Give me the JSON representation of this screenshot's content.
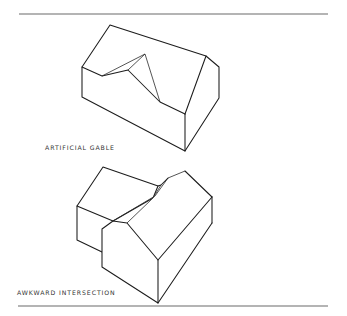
{
  "figures": [
    {
      "id": "artificial-gable",
      "caption": "ARTIFICIAL GABLE",
      "description": "Isometric house with a gable-shaped notch cut into the roof slope"
    },
    {
      "id": "awkward-intersection",
      "caption": "AWKWARD INTERSECTION",
      "description": "Isometric view of two gabled house volumes meeting at an awkward roof junction"
    }
  ],
  "colors": {
    "line": "#1c1c1c",
    "rule": "#6a6a6a",
    "background": "#ffffff",
    "caption": "#333333"
  }
}
